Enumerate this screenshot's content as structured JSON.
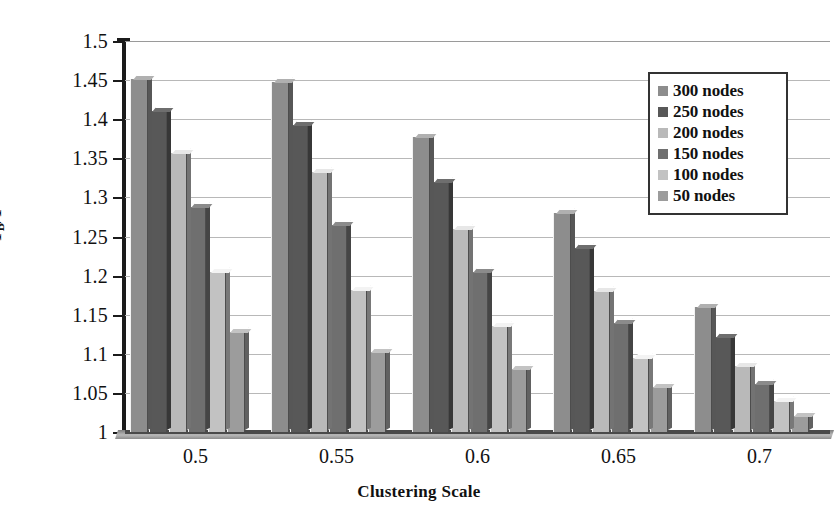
{
  "chart_data": {
    "type": "bar",
    "title": "",
    "xlabel": "Clustering Scale",
    "ylabel": "T_B/T",
    "ylabel_main": "T",
    "ylabel_sub": "B",
    "ylabel_tail": "/T",
    "categories": [
      "0.5",
      "0.55",
      "0.6",
      "0.65",
      "0.7"
    ],
    "ylim": [
      1,
      1.5
    ],
    "ytick_labels": [
      "1.5",
      "1.45",
      "1.4",
      "1.35",
      "1.3",
      "1.25",
      "1.2",
      "1.15",
      "1.1",
      "1.05",
      "1"
    ],
    "ytick_values": [
      1.5,
      1.45,
      1.4,
      1.35,
      1.3,
      1.25,
      1.2,
      1.15,
      1.1,
      1.05,
      1.0
    ],
    "grid": true,
    "legend_position": "top-right",
    "series": [
      {
        "name": "300 nodes",
        "color": "#8d8d8d",
        "values": [
          1.452,
          1.448,
          1.377,
          1.28,
          1.16
        ]
      },
      {
        "name": "250 nodes",
        "color": "#585858",
        "values": [
          1.41,
          1.393,
          1.32,
          1.235,
          1.122
        ]
      },
      {
        "name": "200 nodes",
        "color": "#b9b9b9",
        "values": [
          1.357,
          1.333,
          1.26,
          1.18,
          1.085
        ]
      },
      {
        "name": "150 nodes",
        "color": "#6f6f6f",
        "values": [
          1.288,
          1.265,
          1.205,
          1.14,
          1.062
        ]
      },
      {
        "name": "100 nodes",
        "color": "#c2c2c2",
        "values": [
          1.205,
          1.182,
          1.135,
          1.095,
          1.04
        ]
      },
      {
        "name": "50 nodes",
        "color": "#9c9c9c",
        "values": [
          1.128,
          1.102,
          1.08,
          1.058,
          1.02
        ]
      }
    ]
  },
  "axis": {
    "x_title": "Clustering Scale",
    "y_title": "T_B/T"
  }
}
